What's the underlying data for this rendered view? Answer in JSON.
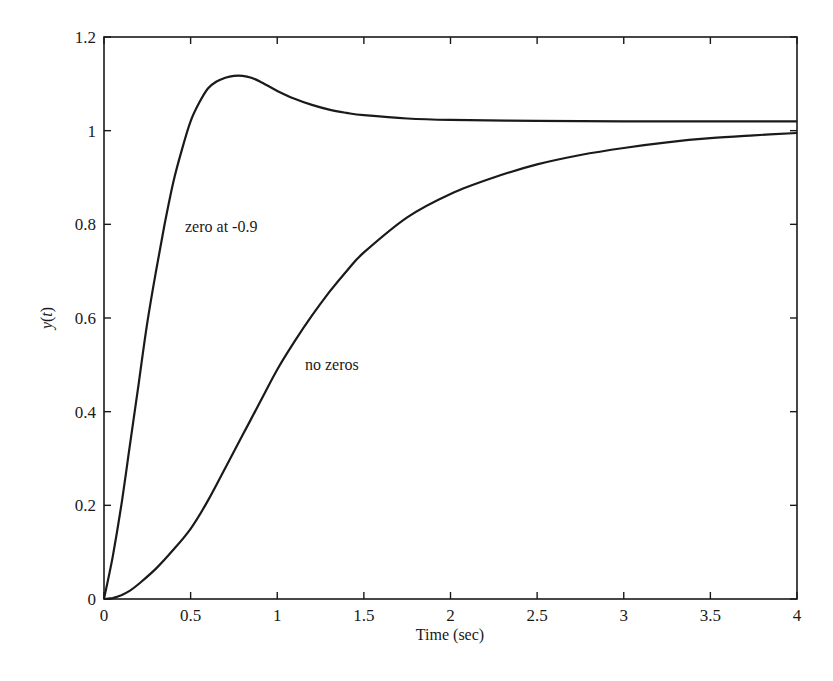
{
  "chart_data": {
    "type": "line",
    "title": "",
    "xlabel": "Time (sec)",
    "ylabel": "y(t)",
    "xlim": [
      0,
      4
    ],
    "ylim": [
      0,
      1.2
    ],
    "grid": false,
    "legend": "none (inline annotations)",
    "xticks": [
      "0",
      "0.5",
      "1",
      "1.5",
      "2",
      "2.5",
      "3",
      "3.5",
      "4"
    ],
    "yticks": [
      "0",
      "0.2",
      "0.4",
      "0.6",
      "0.8",
      "1",
      "1.2"
    ],
    "series": [
      {
        "name": "zero at -0.9",
        "x": [
          0,
          0.05,
          0.1,
          0.15,
          0.2,
          0.25,
          0.3,
          0.35,
          0.4,
          0.45,
          0.5,
          0.55,
          0.6,
          0.65,
          0.7,
          0.75,
          0.8,
          0.85,
          0.9,
          1.0,
          1.1,
          1.2,
          1.3,
          1.4,
          1.5,
          1.75,
          2.0,
          2.5,
          3.0,
          3.5,
          4.0
        ],
        "values": [
          0,
          0.09,
          0.2,
          0.33,
          0.46,
          0.59,
          0.7,
          0.8,
          0.89,
          0.96,
          1.02,
          1.06,
          1.09,
          1.105,
          1.113,
          1.117,
          1.117,
          1.113,
          1.105,
          1.085,
          1.068,
          1.055,
          1.045,
          1.038,
          1.033,
          1.026,
          1.023,
          1.021,
          1.02,
          1.02,
          1.02
        ],
        "annotation": {
          "text": "zero at -0.9",
          "x": 0.47,
          "y": 0.8
        }
      },
      {
        "name": "no zeros",
        "x": [
          0,
          0.05,
          0.1,
          0.15,
          0.2,
          0.3,
          0.4,
          0.5,
          0.6,
          0.7,
          0.8,
          0.9,
          1.0,
          1.1,
          1.2,
          1.3,
          1.4,
          1.5,
          1.75,
          2.0,
          2.25,
          2.5,
          2.75,
          3.0,
          3.25,
          3.5,
          3.75,
          4.0
        ],
        "values": [
          0,
          0.002,
          0.008,
          0.018,
          0.032,
          0.065,
          0.105,
          0.15,
          0.21,
          0.28,
          0.35,
          0.42,
          0.49,
          0.55,
          0.605,
          0.655,
          0.7,
          0.74,
          0.815,
          0.865,
          0.9,
          0.928,
          0.948,
          0.963,
          0.975,
          0.984,
          0.99,
          0.995
        ],
        "annotation": {
          "text": "no zeros",
          "x": 1.17,
          "y": 0.45
        }
      }
    ]
  },
  "labels": {
    "xlabel": "Time (sec)",
    "ylabel_y": "y",
    "ylabel_t": "t",
    "annotation_zero": "zero at -0.9",
    "annotation_nozero": "no zeros"
  }
}
